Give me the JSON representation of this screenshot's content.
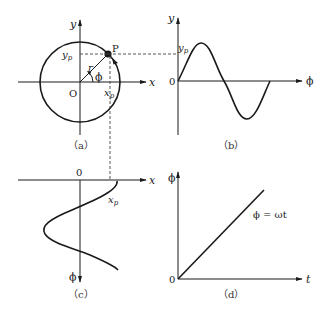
{
  "panels": {
    "a": {
      "caption": "（a）",
      "y_axis_label": "y",
      "x_axis_label": "x",
      "origin_label": "O",
      "point_label": "P",
      "radius_label": "r",
      "angle_label": "ϕ",
      "yp_label": "y",
      "yp_sub": "p",
      "xp_label": "x",
      "xp_sub": "p"
    },
    "b": {
      "caption": "（b）",
      "y_axis_label": "y",
      "x_axis_label": "ϕ",
      "origin_label": "0",
      "yp_label": "y",
      "yp_sub": "p"
    },
    "c": {
      "caption": "（c）",
      "x_axis_label": "x",
      "y_axis_label": "ϕ",
      "origin_label": "0",
      "xp_label": "x",
      "xp_sub": "p"
    },
    "d": {
      "caption": "（d）",
      "y_axis_label": "ϕ",
      "x_axis_label": "t",
      "origin_label": "0",
      "equation": "ϕ = ωt"
    }
  },
  "colors": {
    "ink": "#1a1a1a",
    "dashed": "#444444"
  }
}
